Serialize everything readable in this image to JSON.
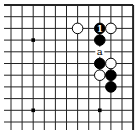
{
  "diagram": {
    "type": "go-board-diagram",
    "region": "upper-right corner",
    "columns": 12,
    "rows": 11,
    "edges": [
      "top",
      "right"
    ],
    "star_points": [
      {
        "col": 2,
        "row": 3
      },
      {
        "col": 2,
        "row": 9
      },
      {
        "col": 8,
        "row": 9
      }
    ],
    "stones": [
      {
        "color": "white",
        "col": 6,
        "row": 2,
        "label": ""
      },
      {
        "color": "black",
        "col": 8,
        "row": 2,
        "label": "1"
      },
      {
        "color": "white",
        "col": 9,
        "row": 2,
        "label": ""
      },
      {
        "color": "black",
        "col": 8,
        "row": 3,
        "label": ""
      },
      {
        "color": "black",
        "col": 8,
        "row": 5,
        "label": ""
      },
      {
        "color": "white",
        "col": 9,
        "row": 5,
        "label": ""
      },
      {
        "color": "white",
        "col": 8,
        "row": 6,
        "label": ""
      },
      {
        "color": "black",
        "col": 9,
        "row": 6,
        "label": ""
      },
      {
        "color": "black",
        "col": 9,
        "row": 7,
        "label": ""
      }
    ],
    "point_labels": [
      {
        "col": 8,
        "row": 4,
        "text": "a"
      }
    ],
    "colors": {
      "black": "#000000",
      "white": "#ffffff",
      "line": "#222222"
    }
  }
}
